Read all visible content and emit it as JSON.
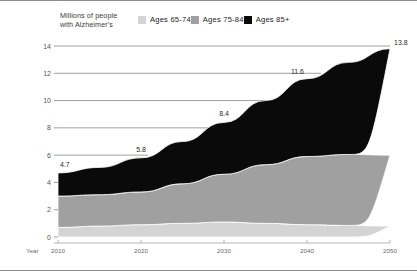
{
  "legend": {
    "title_line1": "Millions of people",
    "title_line2": "with Alzheimer's",
    "items": [
      {
        "label": "Ages 65-74",
        "color": "#d4d4d4"
      },
      {
        "label": "Ages 75-84",
        "color": "#a0a0a0"
      },
      {
        "label": "Ages 85+",
        "color": "#0a0a0a"
      }
    ]
  },
  "axis": {
    "x_title": "Year",
    "y_ticks": [
      "0",
      "2",
      "4",
      "6",
      "8",
      "10",
      "12",
      "14"
    ],
    "x_ticks": [
      "2010",
      "2020",
      "2030",
      "2040",
      "2050"
    ]
  },
  "labels": {
    "v2010": "4.7",
    "v2020": "5.8",
    "v2030": "8.4",
    "v2040": "11.6",
    "v2050": "13.8"
  },
  "chart_data": {
    "type": "area",
    "title": "Millions of people with Alzheimer's",
    "xlabel": "Year",
    "ylabel": "Millions of people with Alzheimer's",
    "x": [
      2010,
      2015,
      2020,
      2025,
      2030,
      2035,
      2040,
      2045,
      2050
    ],
    "xlim": [
      2010,
      2050
    ],
    "ylim": [
      0,
      14
    ],
    "grid": true,
    "legend_position": "top",
    "stacked": true,
    "totals": [
      4.7,
      5.1,
      5.8,
      7.0,
      8.4,
      10.0,
      11.6,
      12.8,
      13.8
    ],
    "data_labels": {
      "2010": 4.7,
      "2020": 5.8,
      "2030": 8.4,
      "2040": 11.6,
      "2050": 13.8
    },
    "series": [
      {
        "name": "Ages 65-74",
        "color": "#d4d4d4",
        "values": [
          0.7,
          0.8,
          0.9,
          1.0,
          1.1,
          1.0,
          0.9,
          0.85,
          0.8
        ]
      },
      {
        "name": "Ages 75-84",
        "color": "#a0a0a0",
        "values": [
          2.3,
          2.3,
          2.4,
          2.9,
          3.5,
          4.3,
          5.0,
          5.2,
          5.2
        ]
      },
      {
        "name": "Ages 85+",
        "color": "#0a0a0a",
        "values": [
          1.7,
          2.0,
          2.5,
          3.1,
          3.8,
          4.7,
          5.7,
          6.75,
          7.8
        ]
      }
    ]
  }
}
